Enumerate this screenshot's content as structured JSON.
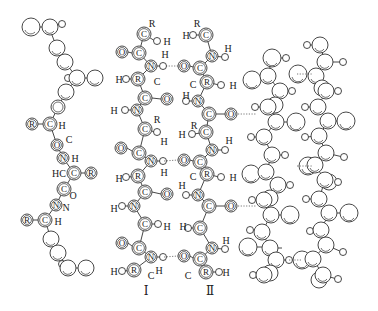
{
  "diagram": {
    "title": "",
    "colors": {
      "line": "#333333",
      "background": "#ffffff"
    },
    "strand_labels": [
      {
        "id": "I",
        "text": "Ⅰ",
        "x": 146,
        "y": 295
      },
      {
        "id": "II",
        "text": "Ⅱ",
        "x": 210,
        "y": 295
      }
    ],
    "helix_labels": [
      {
        "text": "R",
        "x": 32,
        "y": 124,
        "r": 6,
        "circled": true
      },
      {
        "text": "C",
        "x": 50,
        "y": 124,
        "r": 7,
        "circled": true
      },
      {
        "text": "H",
        "x": 62,
        "y": 125,
        "circled": false
      },
      {
        "text": "O",
        "x": 57,
        "y": 145,
        "r": 6,
        "circled": true
      },
      {
        "text": "C",
        "x": 69,
        "y": 139,
        "circled": false
      },
      {
        "text": "N",
        "x": 63,
        "y": 158,
        "r": 6,
        "circled": true
      },
      {
        "text": "H",
        "x": 75,
        "y": 158,
        "circled": false
      },
      {
        "text": "HC",
        "x": 59,
        "y": 173,
        "circled": false
      },
      {
        "text": "C",
        "x": 74,
        "y": 173,
        "r": 7,
        "circled": true
      },
      {
        "text": "R",
        "x": 91,
        "y": 173,
        "r": 6,
        "circled": true
      },
      {
        "text": "C",
        "x": 64,
        "y": 189,
        "r": 7,
        "circled": true
      },
      {
        "text": "O",
        "x": 73,
        "y": 195,
        "circled": false
      },
      {
        "text": "N",
        "x": 56,
        "y": 205,
        "r": 6,
        "circled": true
      },
      {
        "text": "N",
        "x": 66,
        "y": 207,
        "circled": false
      },
      {
        "text": "R",
        "x": 27,
        "y": 220,
        "r": 6,
        "circled": true
      },
      {
        "text": "C",
        "x": 45,
        "y": 220,
        "r": 7,
        "circled": true
      },
      {
        "text": "H",
        "x": 58,
        "y": 221,
        "circled": false
      }
    ],
    "strand_I_labels": [
      {
        "text": "R",
        "x": 152,
        "y": 23
      },
      {
        "text": "C",
        "x": 144,
        "y": 34,
        "r": 7,
        "circled": true
      },
      {
        "text": "H",
        "x": 167,
        "y": 41
      },
      {
        "text": "O",
        "x": 122,
        "y": 52,
        "r": 6,
        "circled": true
      },
      {
        "text": "C",
        "x": 139,
        "y": 53,
        "r": 7,
        "circled": true
      },
      {
        "text": "H",
        "x": 165,
        "y": 54
      },
      {
        "text": "N",
        "x": 151,
        "y": 66,
        "r": 6,
        "circled": true
      },
      {
        "text": "H",
        "x": 119,
        "y": 79
      },
      {
        "text": "R",
        "x": 138,
        "y": 79,
        "r": 7,
        "circled": true
      },
      {
        "text": "C",
        "x": 157,
        "y": 81
      },
      {
        "text": "C",
        "x": 145,
        "y": 98,
        "r": 7,
        "circled": true
      },
      {
        "text": "O",
        "x": 167,
        "y": 99,
        "r": 6,
        "circled": true
      },
      {
        "text": "H",
        "x": 114,
        "y": 110
      },
      {
        "text": "N",
        "x": 137,
        "y": 110,
        "r": 6,
        "circled": true
      },
      {
        "text": "R",
        "x": 157,
        "y": 119
      },
      {
        "text": "C",
        "x": 145,
        "y": 129,
        "r": 7,
        "circled": true
      },
      {
        "text": "H",
        "x": 164,
        "y": 141
      },
      {
        "text": "O",
        "x": 121,
        "y": 148,
        "r": 6,
        "circled": true
      },
      {
        "text": "C",
        "x": 139,
        "y": 153,
        "r": 7,
        "circled": true
      },
      {
        "text": "N",
        "x": 151,
        "y": 161,
        "r": 6,
        "circled": true
      },
      {
        "text": "H",
        "x": 164,
        "y": 172
      },
      {
        "text": "H",
        "x": 119,
        "y": 178
      },
      {
        "text": "R",
        "x": 138,
        "y": 176,
        "r": 7,
        "circled": true
      },
      {
        "text": "C",
        "x": 145,
        "y": 192,
        "r": 7,
        "circled": true
      },
      {
        "text": "O",
        "x": 167,
        "y": 194,
        "r": 6,
        "circled": true
      },
      {
        "text": "H",
        "x": 114,
        "y": 208
      },
      {
        "text": "N",
        "x": 134,
        "y": 206,
        "r": 6,
        "circled": true
      },
      {
        "text": "C",
        "x": 145,
        "y": 224,
        "r": 7,
        "circled": true
      },
      {
        "text": "H",
        "x": 167,
        "y": 226
      },
      {
        "text": "O",
        "x": 122,
        "y": 243,
        "r": 6,
        "circled": true
      },
      {
        "text": "C",
        "x": 139,
        "y": 248,
        "r": 7,
        "circled": true
      },
      {
        "text": "N",
        "x": 151,
        "y": 257,
        "r": 6,
        "circled": true
      },
      {
        "text": "H",
        "x": 159,
        "y": 270
      },
      {
        "text": "H",
        "x": 114,
        "y": 271
      },
      {
        "text": "R",
        "x": 134,
        "y": 270,
        "r": 7,
        "circled": true
      },
      {
        "text": "C",
        "x": 151,
        "y": 275
      }
    ],
    "strand_II_labels": [
      {
        "text": "R",
        "x": 197,
        "y": 23
      },
      {
        "text": "H",
        "x": 186,
        "y": 35
      },
      {
        "text": "C",
        "x": 206,
        "y": 35,
        "r": 7,
        "circled": true
      },
      {
        "text": "H",
        "x": 228,
        "y": 48
      },
      {
        "text": "N",
        "x": 212,
        "y": 56,
        "r": 6,
        "circled": true
      },
      {
        "text": "O",
        "x": 184,
        "y": 66,
        "r": 6,
        "circled": true
      },
      {
        "text": "C",
        "x": 200,
        "y": 68,
        "r": 7,
        "circled": true
      },
      {
        "text": "C",
        "x": 193,
        "y": 84
      },
      {
        "text": "R",
        "x": 207,
        "y": 82,
        "r": 7,
        "circled": true
      },
      {
        "text": "H",
        "x": 233,
        "y": 85
      },
      {
        "text": "H",
        "x": 186,
        "y": 95
      },
      {
        "text": "N",
        "x": 198,
        "y": 101,
        "r": 6,
        "circled": true
      },
      {
        "text": "C",
        "x": 209,
        "y": 114,
        "r": 7,
        "circled": true
      },
      {
        "text": "O",
        "x": 231,
        "y": 114,
        "r": 6,
        "circled": true
      },
      {
        "text": "R",
        "x": 194,
        "y": 125
      },
      {
        "text": "H",
        "x": 182,
        "y": 134
      },
      {
        "text": "C",
        "x": 206,
        "y": 132,
        "r": 7,
        "circled": true
      },
      {
        "text": "H",
        "x": 229,
        "y": 140
      },
      {
        "text": "N",
        "x": 212,
        "y": 150,
        "r": 6,
        "circled": true
      },
      {
        "text": "O",
        "x": 184,
        "y": 160,
        "r": 6,
        "circled": true
      },
      {
        "text": "C",
        "x": 200,
        "y": 162,
        "r": 7,
        "circled": true
      },
      {
        "text": "C",
        "x": 193,
        "y": 176
      },
      {
        "text": "R",
        "x": 207,
        "y": 174,
        "r": 7,
        "circled": true
      },
      {
        "text": "H",
        "x": 233,
        "y": 177
      },
      {
        "text": "H",
        "x": 182,
        "y": 185
      },
      {
        "text": "N",
        "x": 198,
        "y": 195,
        "r": 6,
        "circled": true
      },
      {
        "text": "C",
        "x": 209,
        "y": 206,
        "r": 7,
        "circled": true
      },
      {
        "text": "O",
        "x": 231,
        "y": 206,
        "r": 6,
        "circled": true
      },
      {
        "text": "H",
        "x": 183,
        "y": 226
      },
      {
        "text": "C",
        "x": 200,
        "y": 228,
        "r": 7,
        "circled": true
      },
      {
        "text": "H",
        "x": 226,
        "y": 240
      },
      {
        "text": "N",
        "x": 212,
        "y": 248,
        "r": 6,
        "circled": true
      },
      {
        "text": "O",
        "x": 184,
        "y": 256,
        "r": 6,
        "circled": true
      },
      {
        "text": "C",
        "x": 200,
        "y": 259,
        "r": 7,
        "circled": true
      },
      {
        "text": "C",
        "x": 188,
        "y": 275
      },
      {
        "text": "R",
        "x": 206,
        "y": 272,
        "r": 7,
        "circled": true
      },
      {
        "text": "H",
        "x": 226,
        "y": 272
      }
    ],
    "hydrogen_bonds": [
      {
        "x1": 166,
        "y1": 66,
        "x2": 178,
        "y2": 66
      },
      {
        "x1": 164,
        "y1": 161,
        "x2": 178,
        "y2": 160
      },
      {
        "x1": 164,
        "y1": 257,
        "x2": 178,
        "y2": 256
      },
      {
        "x1": 238,
        "y1": 114,
        "x2": 256,
        "y2": 114
      },
      {
        "x1": 238,
        "y1": 206,
        "x2": 256,
        "y2": 206
      },
      {
        "x1": 297,
        "y1": 74,
        "x2": 312,
        "y2": 74
      },
      {
        "x1": 297,
        "y1": 166,
        "x2": 312,
        "y2": 166
      },
      {
        "x1": 289,
        "y1": 260,
        "x2": 302,
        "y2": 260
      }
    ]
  }
}
